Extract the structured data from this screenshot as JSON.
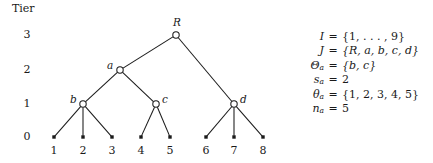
{
  "diagram": {
    "tier_axis": {
      "title": "Tier",
      "ticks": [
        {
          "label": "3",
          "y": 35
        },
        {
          "label": "2",
          "y": 70
        },
        {
          "label": "1",
          "y": 104
        },
        {
          "label": "0",
          "y": 137
        }
      ]
    },
    "nodes": [
      {
        "id": "R",
        "label": "R",
        "x": 176,
        "y": 35,
        "tier": 3,
        "shape": "circle",
        "label_pos": "above"
      },
      {
        "id": "a",
        "label": "a",
        "x": 120,
        "y": 70,
        "tier": 2,
        "shape": "circle",
        "label_pos": "left"
      },
      {
        "id": "b",
        "label": "b",
        "x": 83,
        "y": 104,
        "tier": 1,
        "shape": "circle",
        "label_pos": "left"
      },
      {
        "id": "c",
        "label": "c",
        "x": 156,
        "y": 104,
        "tier": 1,
        "shape": "circle",
        "label_pos": "right"
      },
      {
        "id": "d",
        "label": "d",
        "x": 234,
        "y": 104,
        "tier": 1,
        "shape": "circle",
        "label_pos": "right"
      },
      {
        "id": "1",
        "label": "1",
        "x": 54,
        "y": 137,
        "tier": 0,
        "shape": "dot",
        "label_pos": "below"
      },
      {
        "id": "2",
        "label": "2",
        "x": 83,
        "y": 137,
        "tier": 0,
        "shape": "dot",
        "label_pos": "below"
      },
      {
        "id": "3",
        "label": "3",
        "x": 112,
        "y": 137,
        "tier": 0,
        "shape": "dot",
        "label_pos": "below"
      },
      {
        "id": "4",
        "label": "4",
        "x": 141,
        "y": 137,
        "tier": 0,
        "shape": "dot",
        "label_pos": "below"
      },
      {
        "id": "5",
        "label": "5",
        "x": 170,
        "y": 137,
        "tier": 0,
        "shape": "dot",
        "label_pos": "below"
      },
      {
        "id": "6",
        "label": "6",
        "x": 206,
        "y": 137,
        "tier": 0,
        "shape": "dot",
        "label_pos": "below"
      },
      {
        "id": "7",
        "label": "7",
        "x": 234,
        "y": 137,
        "tier": 0,
        "shape": "dot",
        "label_pos": "below"
      },
      {
        "id": "8",
        "label": "8",
        "x": 263,
        "y": 137,
        "tier": 0,
        "shape": "dot",
        "label_pos": "below"
      }
    ],
    "edges": [
      {
        "from": "R",
        "to": "a"
      },
      {
        "from": "R",
        "to": "d"
      },
      {
        "from": "a",
        "to": "b"
      },
      {
        "from": "a",
        "to": "c"
      },
      {
        "from": "b",
        "to": "1"
      },
      {
        "from": "b",
        "to": "2"
      },
      {
        "from": "b",
        "to": "3"
      },
      {
        "from": "c",
        "to": "4"
      },
      {
        "from": "c",
        "to": "5"
      },
      {
        "from": "d",
        "to": "6"
      },
      {
        "from": "d",
        "to": "7"
      },
      {
        "from": "d",
        "to": "8"
      }
    ],
    "stroke_color": "#1a1a1a",
    "node_fill": "#ffffff"
  },
  "equations": [
    {
      "lhs": "I",
      "sub": "",
      "eq": "=",
      "rhs": "{1, . . . , 9}"
    },
    {
      "lhs": "J",
      "sub": "",
      "eq": "=",
      "rhs": "{R, a, b, c, d}"
    },
    {
      "lhs": "Θ",
      "sub": "a",
      "eq": "=",
      "rhs": "{b, c}"
    },
    {
      "lhs": "s",
      "sub": "a",
      "eq": "=",
      "rhs": "2"
    },
    {
      "lhs": "θ",
      "sub": "a",
      "eq": "=",
      "rhs": "{1, 2, 3, 4, 5}"
    },
    {
      "lhs": "n",
      "sub": "a",
      "eq": "=",
      "rhs": "5"
    }
  ]
}
